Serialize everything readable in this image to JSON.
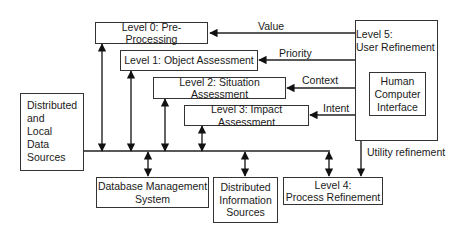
{
  "diagram": {
    "nodes": {
      "level0": {
        "label": "Level 0: Pre-Processing"
      },
      "level1": {
        "label": "Level 1: Object Assessment"
      },
      "level2": {
        "label": "Level 2: Situation Assessment"
      },
      "level3": {
        "label": "Level 3: Impact Assessment"
      },
      "level4": {
        "line1": "Level 4:",
        "line2": "Process Refinement"
      },
      "level5": {
        "line1": "Level 5:",
        "line2": "User Refinement"
      },
      "hci": {
        "line1": "Human",
        "line2": "Computer",
        "line3": "Interface"
      },
      "sources": {
        "line1": "Distributed",
        "line2": "and",
        "line3": "Local",
        "line4": "Data",
        "line5": "Sources"
      },
      "dbms": {
        "line1": "Database Management",
        "line2": "System"
      },
      "dis": {
        "line1": "Distributed",
        "line2": "Information",
        "line3": "Sources"
      }
    },
    "edges": {
      "value": "Value",
      "priority": "Priority",
      "context": "Context",
      "intent": "Intent",
      "utility": "Utility refinement"
    }
  }
}
